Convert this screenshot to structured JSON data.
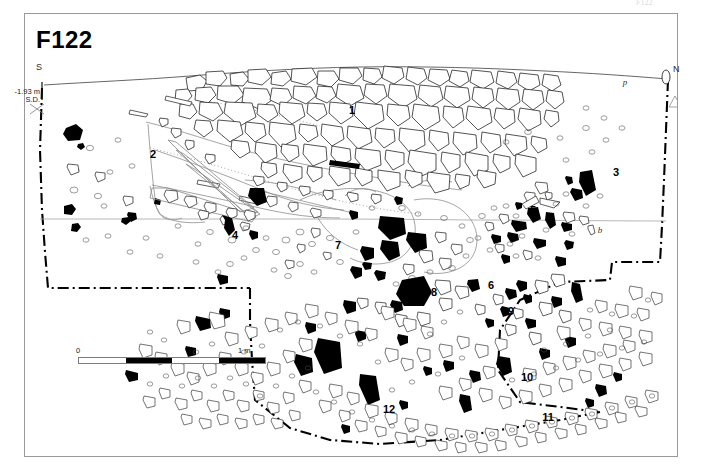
{
  "figure": {
    "title": "F122",
    "type": "archaeological-site-plan",
    "top_note": "F122",
    "orientation": {
      "south_label": "S",
      "north_label": "N"
    },
    "datum": {
      "elevation": "-1.93 m",
      "reference": "S.D."
    },
    "scale": {
      "start_label": "0",
      "end_label": "1 m",
      "segments": 4
    },
    "context_numbers": [
      {
        "label": "1",
        "x": 352,
        "y": 110
      },
      {
        "label": "2",
        "x": 153,
        "y": 154
      },
      {
        "label": "3",
        "x": 616,
        "y": 172
      },
      {
        "label": "4",
        "x": 235,
        "y": 235
      },
      {
        "label": "5",
        "x": 533,
        "y": 210
      },
      {
        "label": "6",
        "x": 491,
        "y": 285
      },
      {
        "label": "7",
        "x": 338,
        "y": 245
      },
      {
        "label": "8",
        "x": 434,
        "y": 292
      },
      {
        "label": "9",
        "x": 511,
        "y": 311
      },
      {
        "label": "10",
        "x": 527,
        "y": 377
      },
      {
        "label": "11",
        "x": 548,
        "y": 417
      },
      {
        "label": "12",
        "x": 389,
        "y": 409
      }
    ],
    "sub_labels": [
      {
        "label": "b",
        "x": 600,
        "y": 230
      },
      {
        "label": "p",
        "x": 625,
        "y": 82
      }
    ],
    "colors": {
      "ink": "#000000",
      "frame": "#9a9a9a",
      "stone_outline": "#1a1a1a",
      "soil_contour": "#6f6f6f",
      "background": "#ffffff"
    }
  }
}
